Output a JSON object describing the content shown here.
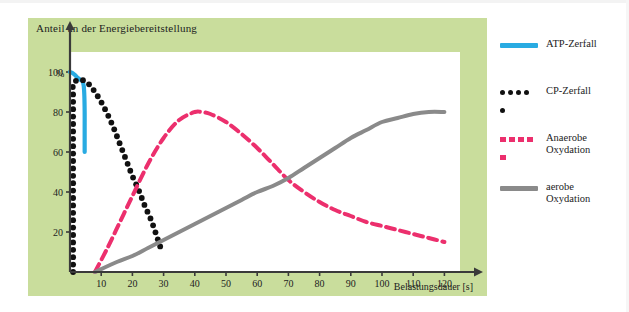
{
  "figure": {
    "title": "Anteil an der Energiebereitstellung",
    "y_unit": "%",
    "x_title": "Belastungsdauer [s]"
  },
  "legend": {
    "position": "right",
    "items": [
      {
        "label": "ATP-Zerfall",
        "style": "solid",
        "color": "#29abe2",
        "icon": "solid-line-swatch"
      },
      {
        "label": "CP-Zerfall",
        "style": "dotted",
        "color": "#111111",
        "icon": "dotted-line-swatch"
      },
      {
        "label": "Anaerobe\nOxydation",
        "style": "dashed",
        "color": "#ec2f6d",
        "icon": "dashed-line-swatch"
      },
      {
        "label": "aerobe\nOxydation",
        "style": "solid",
        "color": "#8a8a8a",
        "icon": "solid-line-swatch"
      }
    ]
  },
  "colors": {
    "panel_background": "#c9dd9c",
    "plot_background": "#ffffff",
    "axis": "#3a3a3a",
    "atp": "#29abe2",
    "cp": "#111111",
    "anaerobic": "#ec2f6d",
    "aerobic": "#8a8a8a"
  },
  "chart_data": {
    "type": "line",
    "title": "Anteil an der Energiebereitstellung",
    "subtitle": "",
    "xlabel": "Belastungsdauer [s]",
    "ylabel": "%",
    "xlim": [
      0,
      125
    ],
    "ylim": [
      0,
      110
    ],
    "xticks": [
      10,
      20,
      30,
      40,
      50,
      60,
      70,
      80,
      90,
      100,
      110,
      120
    ],
    "yticks": [
      20,
      40,
      60,
      80,
      100
    ],
    "grid": false,
    "legend_position": "right",
    "annotations": [],
    "series": [
      {
        "name": "ATP-Zerfall",
        "color": "#29abe2",
        "style": "solid",
        "x": [
          0,
          0.8,
          1.6,
          2.4,
          3.2,
          4.0,
          4.4,
          4.6,
          4.7,
          4.7,
          4.7,
          4.7
        ],
        "y": [
          100,
          99.5,
          98.5,
          97.2,
          96.2,
          95.5,
          93,
          88,
          80,
          72,
          66,
          60
        ]
      },
      {
        "name": "CP-Zerfall",
        "color": "#111111",
        "style": "dotted",
        "x": [
          1,
          1,
          1,
          1,
          1,
          1,
          1,
          1,
          1,
          1,
          1,
          1,
          2.5,
          4,
          6,
          8,
          10,
          12,
          14,
          16,
          18,
          20,
          22,
          24,
          26,
          28,
          29.5
        ],
        "y": [
          0,
          8,
          17,
          25,
          34,
          43,
          52,
          61,
          70,
          79,
          88,
          94,
          96,
          96,
          94,
          90,
          85,
          79,
          72,
          64,
          56,
          48,
          41,
          33,
          26,
          17,
          10
        ]
      },
      {
        "name": "Anaerobe Oxydation",
        "color": "#ec2f6d",
        "style": "dashed",
        "x": [
          8,
          12,
          16,
          20,
          25,
          30,
          35,
          40,
          42,
          45,
          50,
          55,
          60,
          65,
          70,
          75,
          80,
          85,
          90,
          95,
          100,
          105,
          110,
          115,
          120
        ],
        "y": [
          0,
          12,
          25,
          38,
          54,
          67,
          76,
          80,
          80,
          79,
          75,
          69,
          62,
          54,
          46,
          40,
          35,
          31,
          28,
          25,
          23,
          21,
          19,
          17,
          15
        ]
      },
      {
        "name": "aerobe Oxydation",
        "color": "#8a8a8a",
        "style": "solid",
        "x": [
          8,
          15,
          20,
          25,
          30,
          35,
          40,
          45,
          50,
          55,
          60,
          65,
          70,
          75,
          80,
          85,
          90,
          95,
          100,
          105,
          110,
          115,
          120
        ],
        "y": [
          0,
          5,
          8,
          12,
          16,
          20,
          24,
          28,
          32,
          36,
          40,
          43,
          47,
          52,
          57,
          62,
          67,
          71,
          75,
          77,
          79,
          80,
          80
        ]
      }
    ]
  }
}
